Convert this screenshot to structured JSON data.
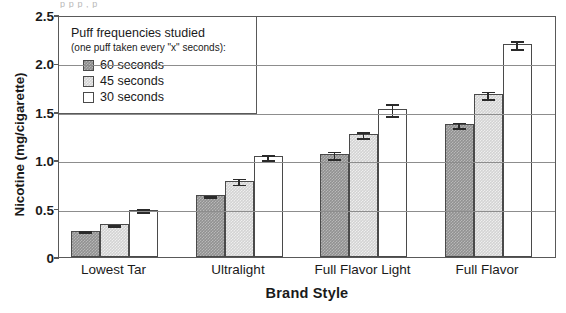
{
  "caption_remnant": "p      p       p   ,                                                    p",
  "axis": {
    "y_title": "Nicotine (mg/cigarette)",
    "x_title": "Brand Style",
    "y_ticks": [
      "2.5",
      "2.0",
      "1.5",
      "1.0",
      "0.5",
      "0"
    ],
    "y_tick_values": [
      2.5,
      2.0,
      1.5,
      1.0,
      0.5,
      0
    ],
    "ylim": [
      0,
      2.5
    ]
  },
  "legend": {
    "title": "Puff frequencies studied",
    "subtitle": "(one puff taken every \"x\" seconds):",
    "items": [
      {
        "label": "60 seconds",
        "color": "#8c8c8c"
      },
      {
        "label": "45 seconds",
        "color": "#d3d3d3"
      },
      {
        "label": "30 seconds",
        "color": "#ffffff"
      }
    ]
  },
  "chart_data": {
    "type": "bar",
    "title": "",
    "xlabel": "Brand Style",
    "ylabel": "Nicotine (mg/cigarette)",
    "ylim": [
      0,
      2.5
    ],
    "ytick_labels": [
      "0",
      "0.5",
      "1.0",
      "1.5",
      "2.0",
      "2.5"
    ],
    "grid": "horizontal",
    "legend_position": "inside-top-left",
    "categories": [
      "Lowest Tar",
      "Ultralight",
      "Full Flavor Light",
      "Full Flavor"
    ],
    "series": [
      {
        "name": "60 seconds",
        "color": "#8c8c8c",
        "values": [
          0.27,
          0.64,
          1.06,
          1.37
        ],
        "errors": [
          0.015,
          0.015,
          0.05,
          0.04
        ]
      },
      {
        "name": "45 seconds",
        "color": "#d3d3d3",
        "values": [
          0.34,
          0.79,
          1.27,
          1.68
        ],
        "errors": [
          0.015,
          0.04,
          0.04,
          0.05
        ]
      },
      {
        "name": "30 seconds",
        "color": "#ffffff",
        "values": [
          0.49,
          1.04,
          1.53,
          2.2
        ],
        "errors": [
          0.025,
          0.035,
          0.07,
          0.05
        ]
      }
    ],
    "annotations": [
      "Error bars denote standard error of the mean"
    ]
  }
}
